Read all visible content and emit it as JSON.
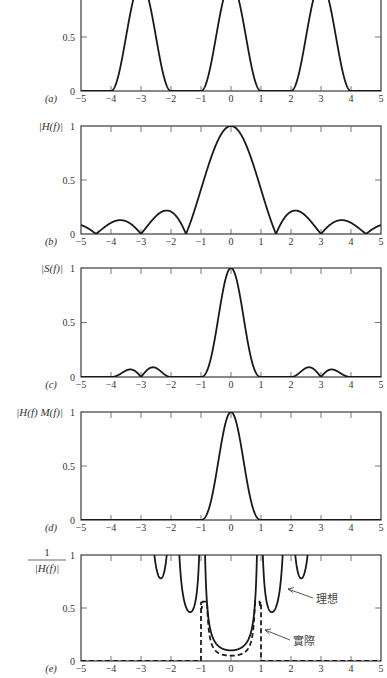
{
  "figure": {
    "x_ticks": [
      "−5",
      "−4",
      "−3",
      "−2",
      "−1",
      "0",
      "1",
      "2",
      "3",
      "4",
      "5"
    ],
    "y_ticks": [
      "0",
      "0.5",
      "1"
    ],
    "x_range": [
      -5,
      5
    ],
    "y_range": [
      0,
      1
    ]
  },
  "panels": [
    {
      "id": "a",
      "label": "(a)",
      "ylabel": "",
      "top_cropped": true
    },
    {
      "id": "b",
      "label": "(b)",
      "ylabel": "|H(f)|"
    },
    {
      "id": "c",
      "label": "(c)",
      "ylabel": "|S(f)|"
    },
    {
      "id": "d",
      "label": "(d)",
      "ylabel": "|H(f) M(f)|"
    },
    {
      "id": "e",
      "label": "(e)",
      "ylabel_num": "1",
      "ylabel_den": "|H(f)|"
    }
  ],
  "annotations": {
    "ideal": "理想",
    "actual": "實際"
  },
  "chart_data": [
    {
      "panel": "(a)",
      "type": "line",
      "title": "",
      "xlabel": "f",
      "ylabel": "",
      "xlim": [
        -5,
        5
      ],
      "ylim": [
        0,
        1
      ],
      "description": "Raised-cosine pulse train centred at f = -3, 0, 3, each with support |f - fc| < 1",
      "x": [
        -5,
        -4,
        -3.5,
        -3,
        -2.5,
        -2,
        -1,
        -0.5,
        0,
        0.5,
        1,
        2,
        2.5,
        3,
        3.5,
        4,
        5
      ],
      "y": [
        0,
        0,
        0.5,
        1,
        0.5,
        0,
        0,
        0.5,
        1,
        0.5,
        0,
        0,
        0.5,
        1,
        0.5,
        0,
        0
      ],
      "series": [
        {
          "name": "M(f)",
          "style": "solid"
        }
      ]
    },
    {
      "panel": "(b)",
      "type": "line",
      "xlabel": "f",
      "ylabel": "|H(f)|",
      "xlim": [
        -5,
        5
      ],
      "ylim": [
        0,
        1
      ],
      "description": "|sinc(2f/3)|, zeros at ±1.5, ±3, ±4.5",
      "x": [
        -5,
        -4.5,
        -3.7,
        -3,
        -2.15,
        -1.5,
        -1,
        -0.5,
        0,
        0.5,
        1,
        1.5,
        2.15,
        3,
        3.7,
        4.5,
        5
      ],
      "y": [
        0.09,
        0,
        0.13,
        0,
        0.22,
        0,
        0.41,
        0.83,
        1,
        0.83,
        0.41,
        0,
        0.22,
        0,
        0.13,
        0,
        0.09
      ],
      "series": [
        {
          "name": "|H(f)|",
          "style": "solid"
        }
      ]
    },
    {
      "panel": "(c)",
      "type": "line",
      "xlabel": "f",
      "ylabel": "|S(f)|",
      "xlim": [
        -5,
        5
      ],
      "ylim": [
        0,
        1
      ],
      "description": "|M(f) H(f)|: central pulse plus small side lobes near ±3",
      "x": [
        -5,
        -4,
        -3.4,
        -3,
        -2.6,
        -2,
        -1,
        -0.5,
        0,
        0.5,
        1,
        2,
        2.6,
        3,
        3.4,
        4,
        5
      ],
      "y": [
        0,
        0,
        0.08,
        0,
        0.09,
        0,
        0,
        0.41,
        1,
        0.41,
        0,
        0,
        0.09,
        0,
        0.08,
        0,
        0
      ],
      "series": [
        {
          "name": "|S(f)|",
          "style": "solid"
        }
      ]
    },
    {
      "panel": "(d)",
      "type": "line",
      "xlabel": "f",
      "ylabel": "|H(f) M(f)|",
      "xlim": [
        -5,
        5
      ],
      "ylim": [
        0,
        1
      ],
      "description": "Central pulse only, support |f| < 1",
      "x": [
        -5,
        -1,
        -0.5,
        0,
        0.5,
        1,
        5
      ],
      "y": [
        0,
        0,
        0.41,
        1,
        0.41,
        0,
        0
      ],
      "series": [
        {
          "name": "|H(f)M(f)|",
          "style": "solid"
        }
      ]
    },
    {
      "panel": "(e)",
      "type": "line",
      "xlabel": "f",
      "ylabel": "1/|H(f)|",
      "xlim": [
        -5,
        5
      ],
      "ylim": [
        0,
        1
      ],
      "description": "Ideal equalizer (solid, clipped at 1) and actual equalizer (dashed, limited to |f|<1)",
      "series": [
        {
          "name": "理想 (ideal)",
          "style": "solid",
          "x": [
            -2.75,
            -2.47,
            -2.2,
            -1.77,
            -1.4,
            -1.07,
            -0.87,
            -0.5,
            0,
            0.5,
            0.87,
            1.07,
            1.4,
            1.77,
            2.2,
            2.47,
            2.75
          ],
          "y": [
            1,
            0.79,
            1,
            1,
            0.47,
            1,
            1,
            0.16,
            0.1,
            0.16,
            1,
            1,
            0.47,
            1,
            1,
            0.79,
            1
          ]
        },
        {
          "name": "實際 (actual)",
          "style": "dashed",
          "x": [
            -5,
            -1,
            -1,
            -0.9,
            -0.5,
            0,
            0.5,
            0.9,
            1,
            1,
            5
          ],
          "y": [
            0,
            0,
            0.56,
            0.5,
            0.1,
            0.05,
            0.1,
            0.5,
            0.56,
            0,
            0
          ]
        }
      ]
    }
  ]
}
